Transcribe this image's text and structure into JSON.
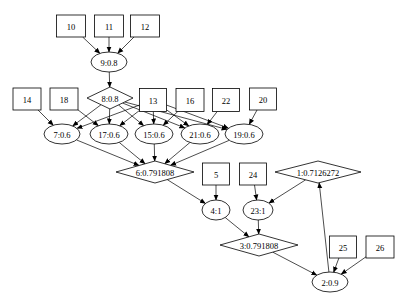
{
  "diagram": {
    "type": "directed-graph",
    "colors": {
      "stroke": "#000000",
      "fill": "#ffffff",
      "background": "#ffffff"
    },
    "nodes": [
      {
        "id": "10",
        "label": "10",
        "shape": "box",
        "x": 71,
        "y": 26,
        "w": 29,
        "h": 22
      },
      {
        "id": "11",
        "label": "11",
        "shape": "box",
        "x": 109,
        "y": 26,
        "w": 29,
        "h": 22
      },
      {
        "id": "12",
        "label": "12",
        "shape": "box",
        "x": 145,
        "y": 26,
        "w": 29,
        "h": 22
      },
      {
        "id": "9",
        "label": "9:0.8",
        "shape": "ellipse",
        "x": 109,
        "y": 62,
        "w": 36,
        "h": 20
      },
      {
        "id": "14",
        "label": "14",
        "shape": "box",
        "x": 27,
        "y": 99,
        "w": 28,
        "h": 22
      },
      {
        "id": "18",
        "label": "18",
        "shape": "box",
        "x": 64,
        "y": 99,
        "w": 28,
        "h": 22
      },
      {
        "id": "8",
        "label": "8:0.8",
        "shape": "diamond",
        "x": 110,
        "y": 98,
        "w": 46,
        "h": 22
      },
      {
        "id": "13",
        "label": "13",
        "shape": "box",
        "x": 153,
        "y": 100,
        "w": 27,
        "h": 23
      },
      {
        "id": "16",
        "label": "16",
        "shape": "box",
        "x": 190,
        "y": 100,
        "w": 28,
        "h": 23
      },
      {
        "id": "22",
        "label": "22",
        "shape": "box",
        "x": 226,
        "y": 100,
        "w": 27,
        "h": 23
      },
      {
        "id": "20",
        "label": "20",
        "shape": "box",
        "x": 263,
        "y": 99,
        "w": 27,
        "h": 22
      },
      {
        "id": "7",
        "label": "7:0.6",
        "shape": "ellipse",
        "x": 62,
        "y": 134,
        "w": 36,
        "h": 20
      },
      {
        "id": "17",
        "label": "17:0.6",
        "shape": "ellipse",
        "x": 109,
        "y": 134,
        "w": 38,
        "h": 20
      },
      {
        "id": "15",
        "label": "15:0.6",
        "shape": "ellipse",
        "x": 154,
        "y": 134,
        "w": 38,
        "h": 20
      },
      {
        "id": "21",
        "label": "21:0.6",
        "shape": "ellipse",
        "x": 200,
        "y": 134,
        "w": 38,
        "h": 20
      },
      {
        "id": "19",
        "label": "19:0.6",
        "shape": "ellipse",
        "x": 244,
        "y": 134,
        "w": 38,
        "h": 20
      },
      {
        "id": "6",
        "label": "6:0.791808",
        "shape": "diamond",
        "x": 155,
        "y": 172,
        "w": 78,
        "h": 22
      },
      {
        "id": "5",
        "label": "5",
        "shape": "box",
        "x": 216,
        "y": 174,
        "w": 27,
        "h": 22
      },
      {
        "id": "24",
        "label": "24",
        "shape": "box",
        "x": 253,
        "y": 174,
        "w": 27,
        "h": 22
      },
      {
        "id": "1",
        "label": "1:0.7126272",
        "shape": "diamond",
        "x": 318,
        "y": 172,
        "w": 86,
        "h": 22
      },
      {
        "id": "4",
        "label": "4:1",
        "shape": "ellipse",
        "x": 216,
        "y": 210,
        "w": 28,
        "h": 20
      },
      {
        "id": "23",
        "label": "23:1",
        "shape": "ellipse",
        "x": 258,
        "y": 210,
        "w": 30,
        "h": 20
      },
      {
        "id": "3",
        "label": "3:0.791808",
        "shape": "diamond",
        "x": 259,
        "y": 245,
        "w": 78,
        "h": 22
      },
      {
        "id": "25",
        "label": "25",
        "shape": "box",
        "x": 343,
        "y": 247,
        "w": 27,
        "h": 22
      },
      {
        "id": "26",
        "label": "26",
        "shape": "box",
        "x": 380,
        "y": 247,
        "w": 28,
        "h": 22
      },
      {
        "id": "2",
        "label": "2:0.9",
        "shape": "ellipse",
        "x": 330,
        "y": 282,
        "w": 36,
        "h": 20
      }
    ],
    "edges": [
      {
        "from": "10",
        "to": "9"
      },
      {
        "from": "11",
        "to": "9"
      },
      {
        "from": "12",
        "to": "9"
      },
      {
        "from": "9",
        "to": "8"
      },
      {
        "from": "14",
        "to": "7"
      },
      {
        "from": "18",
        "to": "17"
      },
      {
        "from": "8",
        "to": "7"
      },
      {
        "from": "8",
        "to": "17"
      },
      {
        "from": "8",
        "to": "15"
      },
      {
        "from": "8",
        "to": "21"
      },
      {
        "from": "8",
        "to": "19"
      },
      {
        "from": "13",
        "to": "7"
      },
      {
        "from": "13",
        "to": "17"
      },
      {
        "from": "13",
        "to": "15"
      },
      {
        "from": "13",
        "to": "21"
      },
      {
        "from": "13",
        "to": "19"
      },
      {
        "from": "16",
        "to": "15"
      },
      {
        "from": "22",
        "to": "21"
      },
      {
        "from": "20",
        "to": "19"
      },
      {
        "from": "7",
        "to": "6"
      },
      {
        "from": "17",
        "to": "6"
      },
      {
        "from": "15",
        "to": "6"
      },
      {
        "from": "21",
        "to": "6"
      },
      {
        "from": "19",
        "to": "6"
      },
      {
        "from": "6",
        "to": "4"
      },
      {
        "from": "5",
        "to": "4"
      },
      {
        "from": "24",
        "to": "23"
      },
      {
        "from": "1",
        "to": "23"
      },
      {
        "from": "4",
        "to": "3"
      },
      {
        "from": "23",
        "to": "3"
      },
      {
        "from": "3",
        "to": "2"
      },
      {
        "from": "25",
        "to": "2"
      },
      {
        "from": "26",
        "to": "2"
      },
      {
        "from": "2",
        "to": "1"
      }
    ]
  }
}
